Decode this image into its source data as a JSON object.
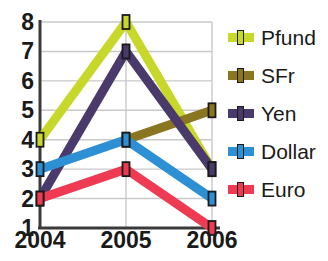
{
  "chart_data": {
    "type": "line",
    "title": "",
    "xlabel": "",
    "ylabel": "",
    "categories": [
      "2004",
      "2005",
      "2006"
    ],
    "x_tick_labels": [
      "2004",
      "2005",
      "2006"
    ],
    "y_tick_labels": [
      "1",
      "2",
      "3",
      "4",
      "5",
      "6",
      "7",
      "8"
    ],
    "ylim": [
      1,
      8
    ],
    "grid": true,
    "legend_position": "right",
    "series": [
      {
        "name": "Pfund",
        "color": "#c8d82a",
        "values": [
          4,
          8,
          3
        ]
      },
      {
        "name": "SFr",
        "color": "#8a7520",
        "values": [
          null,
          4,
          5
        ]
      },
      {
        "name": "Yen",
        "color": "#4a3a6b",
        "values": [
          2,
          7,
          3
        ]
      },
      {
        "name": "Dollar",
        "color": "#2d8fd4",
        "values": [
          3,
          4,
          2
        ]
      },
      {
        "name": "Euro",
        "color": "#ee3a52",
        "values": [
          2,
          3,
          1
        ]
      }
    ]
  },
  "legend": {
    "items": [
      {
        "label": "Pfund",
        "color": "#c8d82a"
      },
      {
        "label": "SFr",
        "color": "#8a7520"
      },
      {
        "label": "Yen",
        "color": "#4a3a6b"
      },
      {
        "label": "Dollar",
        "color": "#2d8fd4"
      },
      {
        "label": "Euro",
        "color": "#ee3a52"
      }
    ]
  },
  "axis": {
    "line_color": "#3a3a3a",
    "grid_color": "#c9c9c9"
  }
}
